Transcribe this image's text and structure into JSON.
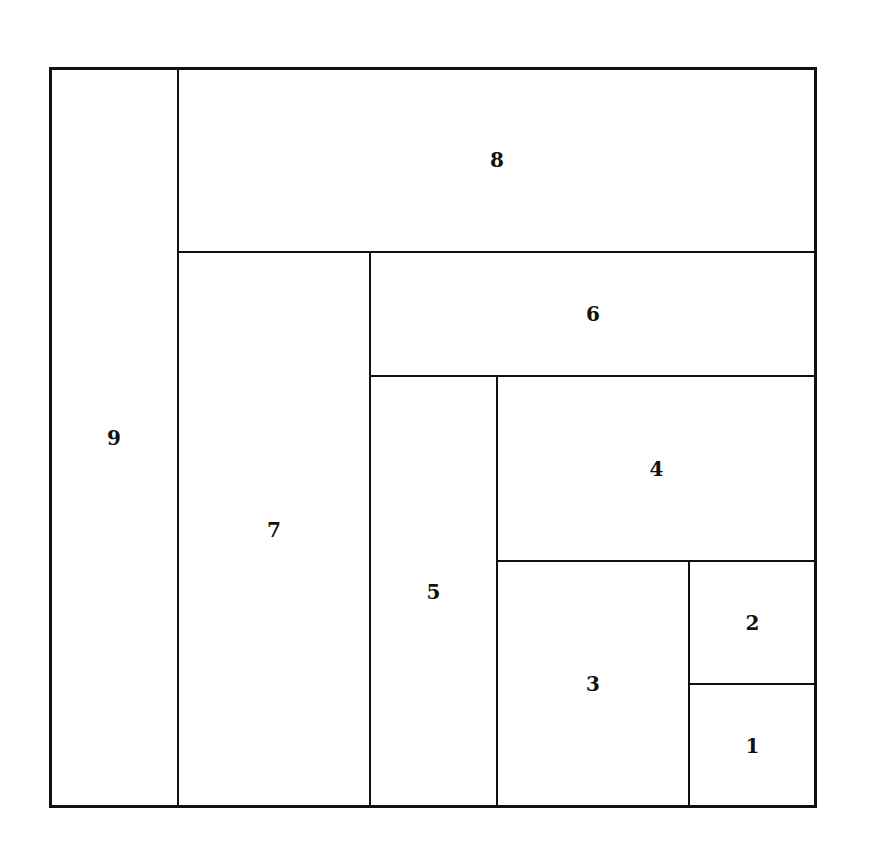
{
  "diagram": {
    "type": "treemap-spiral",
    "cells": [
      {
        "label": "9",
        "x": 49,
        "y": 67,
        "w": 130,
        "h": 741
      },
      {
        "label": "8",
        "x": 178,
        "y": 67,
        "w": 639,
        "h": 186
      },
      {
        "label": "7",
        "x": 178,
        "y": 252,
        "w": 193,
        "h": 556
      },
      {
        "label": "6",
        "x": 370,
        "y": 252,
        "w": 447,
        "h": 125
      },
      {
        "label": "5",
        "x": 370,
        "y": 376,
        "w": 128,
        "h": 432
      },
      {
        "label": "4",
        "x": 497,
        "y": 376,
        "w": 320,
        "h": 186
      },
      {
        "label": "3",
        "x": 497,
        "y": 561,
        "w": 193,
        "h": 247
      },
      {
        "label": "2",
        "x": 689,
        "y": 561,
        "w": 128,
        "h": 124
      },
      {
        "label": "1",
        "x": 689,
        "y": 684,
        "w": 128,
        "h": 124
      }
    ]
  }
}
